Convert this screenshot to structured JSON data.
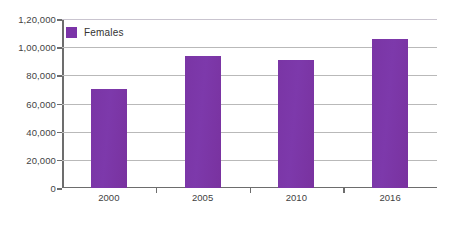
{
  "chart_data": {
    "type": "bar",
    "title": "",
    "subtitle": "",
    "xlabel": "",
    "ylabel": "",
    "categories": [
      "2000",
      "2005",
      "2010",
      "2016"
    ],
    "series": [
      {
        "name": "Females",
        "color": "#7b34a8",
        "values": [
          70000,
          93500,
          91000,
          106000
        ]
      }
    ],
    "ylim": [
      0,
      120000
    ],
    "ytick_values": [
      0,
      20000,
      40000,
      60000,
      80000,
      100000,
      120000
    ],
    "ytick_labels": [
      "0",
      "20,000",
      "40,000",
      "60,000",
      "80,000",
      "1,00,000",
      "1,20,000"
    ],
    "grid": true,
    "grid_axis": "y",
    "legend": {
      "position": "top-left-inside",
      "entries": [
        {
          "label": "Females",
          "color": "#7b34a8",
          "marker": "square-swatch"
        }
      ]
    },
    "annotations": [],
    "number_format": "indian-lakh-grouping",
    "background_color": "#ffffff",
    "gridline_color": "#b9b9b9",
    "axis_color": "#6d6d6d"
  }
}
